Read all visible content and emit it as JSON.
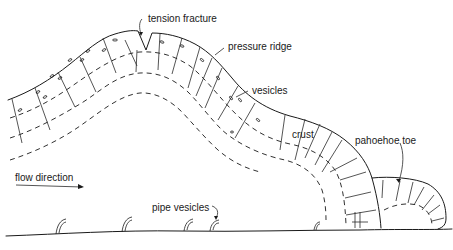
{
  "diagram": {
    "labels": {
      "tension_fracture": "tension fracture",
      "pressure_ridge": "pressure ridge",
      "vesicles": "vesicles",
      "crust": "crust",
      "pahoehoe_toe": "pahoehoe toe",
      "flow_direction": "flow direction",
      "pipe_vesicles": "pipe vesicles"
    },
    "colors": {
      "ink": "#1a1a1a",
      "background": "#ffffff"
    }
  }
}
